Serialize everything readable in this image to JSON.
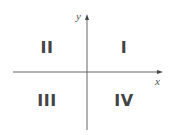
{
  "axes": {
    "x_label": "x",
    "y_label": "y",
    "color": "#555555"
  },
  "quadrants": [
    {
      "id": "I",
      "label": "I"
    },
    {
      "id": "II",
      "label": "II"
    },
    {
      "id": "III",
      "label": "III"
    },
    {
      "id": "IV",
      "label": "IV"
    }
  ]
}
